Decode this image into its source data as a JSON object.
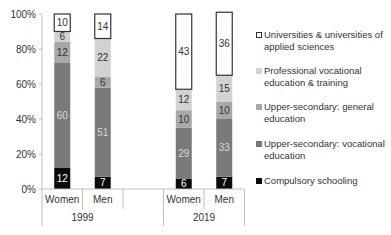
{
  "chart_data": {
    "type": "bar",
    "stacked": true,
    "title": "",
    "xlabel": "",
    "ylabel": "",
    "ylim": [
      0,
      100
    ],
    "yticks": [
      "0%",
      "20%",
      "40%",
      "60%",
      "80%",
      "100%"
    ],
    "groups": [
      {
        "label": "1999",
        "categories": [
          "Women",
          "Men"
        ]
      },
      {
        "label": "2019",
        "categories": [
          "Women",
          "Men"
        ]
      }
    ],
    "categories": [
      "Women 1999",
      "Men 1999",
      "Women 2019",
      "Men 2019"
    ],
    "series": [
      {
        "name": "Compulsory schooling",
        "color": "#0a0a0a",
        "label_color": "#ffffff",
        "values": [
          12,
          7,
          6,
          7
        ]
      },
      {
        "name": "Upper-secondary: vocational education",
        "color": "#7a7a7a",
        "label_color": "#d8d8d8",
        "values": [
          60,
          51,
          29,
          33
        ]
      },
      {
        "name": "Upper-secondary: general education",
        "color": "#a8a8a8",
        "label_color": "#333333",
        "values": [
          12,
          6,
          10,
          10
        ]
      },
      {
        "name": "Professional vocational education & training",
        "color": "#d2d2d2",
        "label_color": "#333333",
        "values": [
          6,
          22,
          12,
          15
        ]
      },
      {
        "name": "Universities & universities of applied sciences",
        "color": "#ffffff",
        "label_color": "#333333",
        "values": [
          10,
          14,
          43,
          36
        ]
      }
    ],
    "legend_position": "right",
    "legend_order": [
      "Universities & universities of applied sciences",
      "Professional vocational education & training",
      "Upper-secondary: general education",
      "Upper-secondary: vocational education",
      "Compulsory schooling"
    ],
    "grid": false
  },
  "legend": {
    "items": [
      {
        "label_line1": "Universities & universities of",
        "label_line2": "applied sciences",
        "color": "#ffffff",
        "border": "#333333"
      },
      {
        "label_line1": "Professional vocational",
        "label_line2": "education & training",
        "color": "#d2d2d2",
        "border": "#d2d2d2"
      },
      {
        "label_line1": "Upper-secondary: general",
        "label_line2": "education",
        "color": "#a8a8a8",
        "border": "#a8a8a8"
      },
      {
        "label_line1": "Upper-secondary: vocational",
        "label_line2": "education",
        "color": "#7a7a7a",
        "border": "#7a7a7a"
      },
      {
        "label_line1": "Compulsory schooling",
        "label_line2": "",
        "color": "#0a0a0a",
        "border": "#0a0a0a"
      }
    ]
  }
}
